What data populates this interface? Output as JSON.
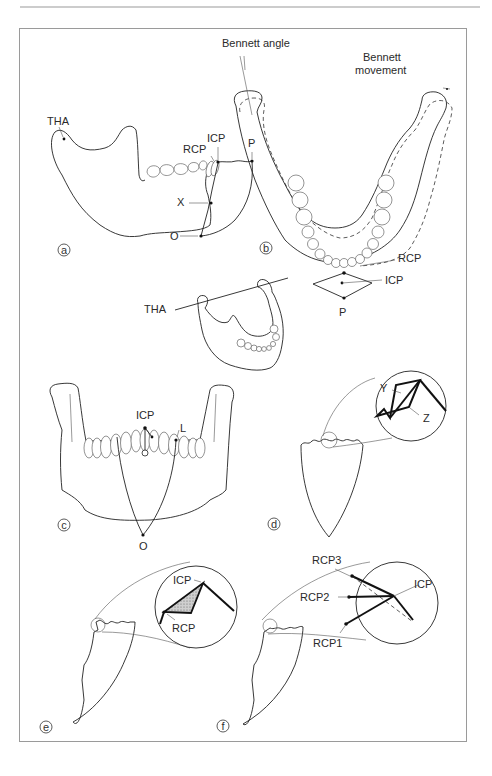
{
  "figure": {
    "panels": [
      {
        "id": "a",
        "label": "a",
        "annotations": [
          "THA",
          "RCP",
          "ICP",
          "P",
          "X",
          "O"
        ]
      },
      {
        "id": "b",
        "label": "b",
        "annotations": [
          "Bennett angle",
          "Bennett movement",
          "RCP",
          "ICP",
          "P",
          "THA"
        ]
      },
      {
        "id": "c",
        "label": "c",
        "annotations": [
          "ICP",
          "L",
          "O"
        ]
      },
      {
        "id": "d",
        "label": "d",
        "annotations": [
          "Y",
          "Z"
        ]
      },
      {
        "id": "e",
        "label": "e",
        "annotations": [
          "ICP",
          "RCP"
        ]
      },
      {
        "id": "f",
        "label": "f",
        "annotations": [
          "RCP3",
          "RCP2",
          "RCP1",
          "ICP"
        ]
      }
    ]
  },
  "labels": {
    "a_tha": "THA",
    "a_rcp": "RCP",
    "a_icp": "ICP",
    "a_p": "P",
    "a_x": "X",
    "a_o": "O",
    "b_bennett_angle": "Bennett angle",
    "b_bennett_movement_1": "Bennett",
    "b_bennett_movement_2": "movement",
    "b_rcp": "RCP",
    "b_icp": "ICP",
    "b_p": "P",
    "b_tha": "THA",
    "c_icp": "ICP",
    "c_l": "L",
    "c_o": "O",
    "d_y": "Y",
    "d_z": "Z",
    "e_icp": "ICP",
    "e_rcp": "RCP",
    "f_rcp3": "RCP3",
    "f_rcp2": "RCP2",
    "f_rcp1": "RCP1",
    "f_icp": "ICP",
    "panel_a": "a",
    "panel_b": "b",
    "panel_c": "c",
    "panel_d": "d",
    "panel_e": "e",
    "panel_f": "f"
  },
  "colors": {
    "line": "#222222",
    "frame": "#888888",
    "shading": "#999999"
  }
}
